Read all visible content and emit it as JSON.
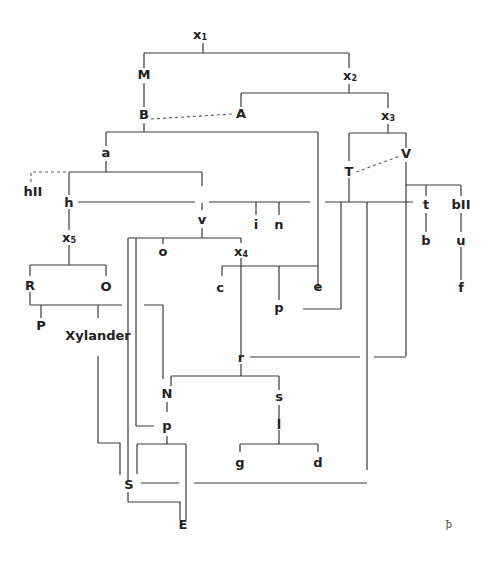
{
  "diagram": {
    "type": "stemma codicum",
    "nodes": {
      "x1": {
        "base": "x",
        "sub": "1"
      },
      "x2": {
        "base": "x",
        "sub": "2"
      },
      "x3": {
        "base": "x",
        "sub": "3"
      },
      "x4": {
        "base": "x",
        "sub": "4"
      },
      "x5": {
        "base": "x",
        "sub": "5"
      },
      "M": "M",
      "B": "B",
      "A": "A",
      "T": "T",
      "V": "V",
      "a": "a",
      "hII": "hII",
      "h": "h",
      "v": "v",
      "i": "i",
      "n": "n",
      "t": "t",
      "b": "b",
      "bII": "bII",
      "u": "u",
      "f": "f",
      "o": "o",
      "c": "c",
      "p_upper": "p",
      "e": "e",
      "R": "R",
      "O": "O",
      "P": "P",
      "Xylander": "Xylander",
      "r": "r",
      "N": "N",
      "s": "s",
      "l": "l",
      "p_lower": "p",
      "g": "g",
      "d": "d",
      "S": "S",
      "E": "E"
    },
    "contamination_links": [
      {
        "from": "B",
        "to": "A"
      },
      {
        "from": "T",
        "to": "V"
      },
      {
        "from": "a",
        "to": "hII"
      }
    ],
    "corner_mark": "ꝥ"
  }
}
